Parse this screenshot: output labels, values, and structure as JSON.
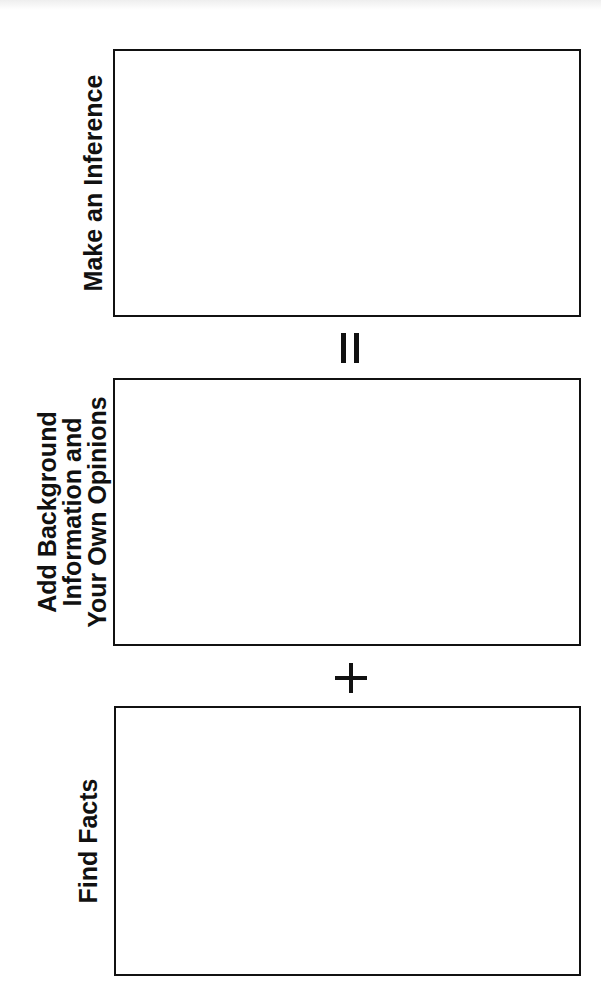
{
  "diagram": {
    "steps": [
      {
        "label": "Make an Inference"
      },
      {
        "label_lines": [
          "Add Background",
          "Information and",
          "Your Own Opinions"
        ]
      },
      {
        "label": "Find Facts"
      }
    ],
    "operators": [
      {
        "symbol": "=",
        "icon": "equals-sign-icon"
      },
      {
        "symbol": "+",
        "icon": "plus-sign-icon"
      }
    ],
    "colors": {
      "line": "#111111",
      "background": "#ffffff"
    }
  }
}
